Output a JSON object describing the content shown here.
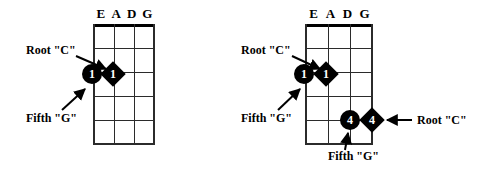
{
  "page": {
    "background": "#ffffff",
    "ink": "#000000"
  },
  "diagrams": [
    {
      "id": "left",
      "name": "diagram-open-position",
      "string_labels": [
        "E",
        "A",
        "D",
        "G"
      ],
      "fret_count": 5,
      "markers": [
        {
          "shape": "circle",
          "label": "1",
          "string": "E",
          "fret": 3,
          "name": "marker-root-c"
        },
        {
          "shape": "diamond",
          "label": "1",
          "string": "A",
          "fret": 3,
          "name": "marker-fifth-g"
        }
      ],
      "callouts": [
        {
          "text": "Root \"C\"",
          "name": "callout-root-c",
          "position": "upper-left"
        },
        {
          "text": "Fifth \"G\"",
          "name": "callout-fifth-g",
          "position": "lower-left"
        }
      ]
    },
    {
      "id": "right",
      "name": "diagram-two-octave-position",
      "string_labels": [
        "E",
        "A",
        "D",
        "G"
      ],
      "fret_count": 5,
      "markers": [
        {
          "shape": "circle",
          "label": "1",
          "string": "E",
          "fret": 3,
          "name": "marker-root-c-low"
        },
        {
          "shape": "diamond",
          "label": "1",
          "string": "A",
          "fret": 3,
          "name": "marker-fifth-g-low"
        },
        {
          "shape": "circle",
          "label": "4",
          "string": "D",
          "fret": 5,
          "name": "marker-fifth-g-high"
        },
        {
          "shape": "diamond",
          "label": "4",
          "string": "G",
          "fret": 5,
          "name": "marker-root-c-high"
        }
      ],
      "callouts": [
        {
          "text": "Root \"C\"",
          "name": "callout-root-c-low",
          "position": "upper-left"
        },
        {
          "text": "Fifth \"G\"",
          "name": "callout-fifth-g-low",
          "position": "lower-left"
        },
        {
          "text": "Root \"C\"",
          "name": "callout-root-c-high",
          "position": "right"
        },
        {
          "text": "Fifth \"G\"",
          "name": "callout-fifth-g-high",
          "position": "bottom"
        }
      ]
    }
  ]
}
